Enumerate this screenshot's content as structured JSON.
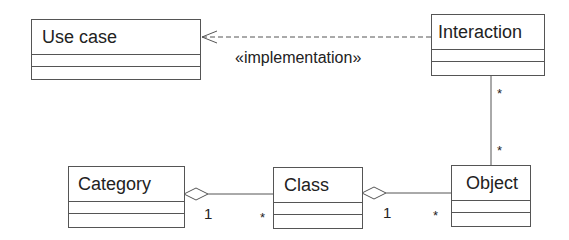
{
  "classes": {
    "use_case": {
      "name": "Use case"
    },
    "interaction": {
      "name": "Interaction"
    },
    "category": {
      "name": "Category"
    },
    "class": {
      "name": "Class"
    },
    "object": {
      "name": "Object"
    }
  },
  "relations": {
    "implementation": {
      "stereotype": "«implementation»",
      "from": "Interaction",
      "to": "Use case",
      "type": "dependency"
    },
    "interaction_object": {
      "from": "Interaction",
      "to": "Object",
      "type": "association",
      "mult_top": "*",
      "mult_bottom": "*"
    },
    "category_class": {
      "from": "Category",
      "to": "Class",
      "type": "aggregation",
      "mult_whole": "1",
      "mult_part": "*"
    },
    "class_object": {
      "from": "Class",
      "to": "Object",
      "type": "aggregation",
      "mult_whole": "1",
      "mult_part": "*"
    }
  },
  "colors": {
    "line": "#555555",
    "text": "#222222",
    "background": "#ffffff"
  }
}
